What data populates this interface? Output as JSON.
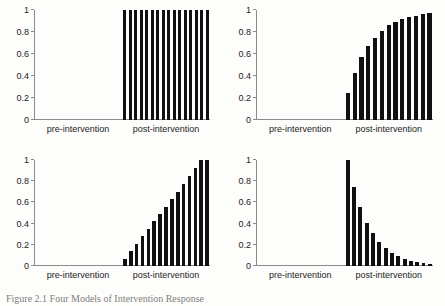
{
  "figure": {
    "caption": "Figure 2.1 Four Models of Intervention Response",
    "background_color": "#fdfdfb",
    "bar_color": "#111111",
    "axis_color": "#8b8b8b"
  },
  "axis": {
    "y_ticks": [
      "0",
      "0.2",
      "0.4",
      "0.6",
      "0.8",
      "1"
    ],
    "x_labels": [
      "pre-intervention",
      "post-intervention"
    ]
  },
  "chart_data": [
    {
      "type": "bar",
      "title": "",
      "panel": "top-left",
      "pattern": "immediate-sustained-step",
      "xlabel": "",
      "ylabel": "",
      "ylim": [
        0,
        1
      ],
      "grid": false,
      "legend": "none",
      "x_tick_labels": [
        "pre-intervention",
        "post-intervention"
      ],
      "y_tick_labels": [
        "0",
        "0.2",
        "0.4",
        "0.6",
        "0.8",
        "1"
      ],
      "categories": [
        "pre",
        "pre",
        "pre",
        "pre",
        "pre",
        "pre",
        "pre",
        "pre",
        "pre",
        "pre",
        "pre",
        "pre",
        "pre",
        "pre",
        "pre",
        "pre",
        "post",
        "post",
        "post",
        "post",
        "post",
        "post",
        "post",
        "post",
        "post",
        "post",
        "post",
        "post",
        "post",
        "post",
        "post",
        "post"
      ],
      "values": [
        0,
        0,
        0,
        0,
        0,
        0,
        0,
        0,
        0,
        0,
        0,
        0,
        0,
        0,
        0,
        0,
        1,
        1,
        1,
        1,
        1,
        1,
        1,
        1,
        1,
        1,
        1,
        1,
        1,
        1,
        1,
        1
      ]
    },
    {
      "type": "bar",
      "title": "",
      "panel": "top-right",
      "pattern": "gradual-saturating-rise",
      "xlabel": "",
      "ylabel": "",
      "ylim": [
        0,
        1
      ],
      "grid": false,
      "legend": "none",
      "x_tick_labels": [
        "pre-intervention",
        "post-intervention"
      ],
      "y_tick_labels": [
        "0",
        "0.2",
        "0.4",
        "0.6",
        "0.8",
        "1"
      ],
      "categories": [
        "pre",
        "pre",
        "pre",
        "pre",
        "pre",
        "pre",
        "pre",
        "pre",
        "pre",
        "pre",
        "pre",
        "pre",
        "pre",
        "post",
        "post",
        "post",
        "post",
        "post",
        "post",
        "post",
        "post",
        "post",
        "post",
        "post",
        "post",
        "post"
      ],
      "values": [
        0,
        0,
        0,
        0,
        0,
        0,
        0,
        0,
        0,
        0,
        0,
        0,
        0,
        0.25,
        0.43,
        0.57,
        0.67,
        0.75,
        0.81,
        0.86,
        0.89,
        0.92,
        0.94,
        0.95,
        0.96,
        0.97
      ]
    },
    {
      "type": "bar",
      "title": "",
      "panel": "bottom-left",
      "pattern": "linear-ramp",
      "xlabel": "",
      "ylabel": "",
      "ylim": [
        0,
        1
      ],
      "grid": false,
      "legend": "none",
      "x_tick_labels": [
        "pre-intervention",
        "post-intervention"
      ],
      "y_tick_labels": [
        "0",
        "0.2",
        "0.4",
        "0.6",
        "0.8",
        "1"
      ],
      "categories": [
        "pre",
        "pre",
        "pre",
        "pre",
        "pre",
        "pre",
        "pre",
        "pre",
        "pre",
        "pre",
        "pre",
        "pre",
        "pre",
        "pre",
        "pre",
        "post",
        "post",
        "post",
        "post",
        "post",
        "post",
        "post",
        "post",
        "post",
        "post",
        "post",
        "post",
        "post",
        "post",
        "post"
      ],
      "values": [
        0,
        0,
        0,
        0,
        0,
        0,
        0,
        0,
        0,
        0,
        0,
        0,
        0,
        0,
        0,
        0.07,
        0.14,
        0.21,
        0.28,
        0.35,
        0.42,
        0.49,
        0.56,
        0.63,
        0.7,
        0.77,
        0.85,
        0.92,
        1.0,
        1.0
      ]
    },
    {
      "type": "bar",
      "title": "",
      "panel": "bottom-right",
      "pattern": "exponential-decay",
      "xlabel": "",
      "ylabel": "",
      "ylim": [
        0,
        1
      ],
      "grid": false,
      "legend": "none",
      "x_tick_labels": [
        "pre-intervention",
        "post-intervention"
      ],
      "y_tick_labels": [
        "0",
        "0.2",
        "0.4",
        "0.6",
        "0.8",
        "1"
      ],
      "categories": [
        "pre",
        "pre",
        "pre",
        "pre",
        "pre",
        "pre",
        "pre",
        "pre",
        "pre",
        "pre",
        "pre",
        "pre",
        "pre",
        "pre",
        "post",
        "post",
        "post",
        "post",
        "post",
        "post",
        "post",
        "post",
        "post",
        "post",
        "post",
        "post",
        "post",
        "post"
      ],
      "values": [
        0,
        0,
        0,
        0,
        0,
        0,
        0,
        0,
        0,
        0,
        0,
        0,
        0,
        0,
        1.0,
        0.75,
        0.56,
        0.41,
        0.31,
        0.23,
        0.17,
        0.12,
        0.09,
        0.07,
        0.05,
        0.04,
        0.03,
        0.02
      ]
    }
  ]
}
